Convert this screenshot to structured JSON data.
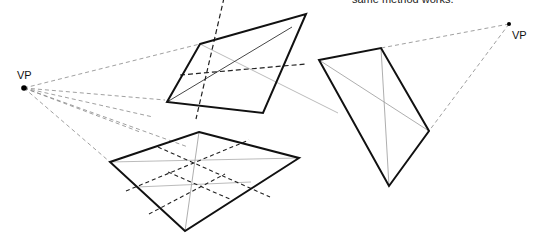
{
  "caption": "same method works.",
  "vanishing_points": [
    {
      "label": "VP",
      "x": 24,
      "y": 88
    },
    {
      "label": "VP",
      "x": 509,
      "y": 24
    }
  ],
  "colors": {
    "outline": "#111111",
    "guide": "#888888",
    "diagonal": "#999999",
    "dashed_axis": "#222222"
  }
}
